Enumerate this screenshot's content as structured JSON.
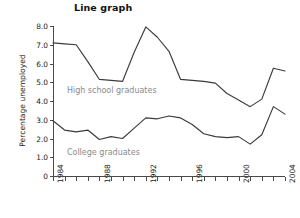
{
  "chart_data": {
    "type": "line",
    "title": "Line graph",
    "xlabel": "",
    "ylabel": "Percentage unemployed",
    "grid": false,
    "legend_position": "inline-annotation",
    "xlim": [
      1984,
      2004
    ],
    "ylim": [
      0,
      8
    ],
    "x": [
      1984,
      1985,
      1986,
      1987,
      1988,
      1989,
      1990,
      1991,
      1992,
      1993,
      1994,
      1995,
      1996,
      1997,
      1998,
      1999,
      2000,
      2001,
      2002,
      2003,
      2004
    ],
    "x_tick_labels": [
      "1984",
      "1988",
      "1992",
      "1996",
      "2000",
      "2004"
    ],
    "x_tick_values": [
      1984,
      1988,
      1992,
      1996,
      2000,
      2004
    ],
    "y_tick_labels": [
      "0",
      "1.0",
      "2.0",
      "3.0",
      "4.0",
      "5.0",
      "6.0",
      "7.0",
      "8.0"
    ],
    "y_tick_values": [
      0,
      1,
      2,
      3,
      4,
      5,
      6,
      7,
      8
    ],
    "series": [
      {
        "name": "High school graduates",
        "values": [
          7.1,
          7.05,
          7.0,
          6.1,
          5.15,
          5.1,
          5.05,
          6.6,
          7.95,
          7.4,
          6.65,
          5.15,
          5.1,
          5.05,
          4.95,
          4.4,
          4.05,
          3.7,
          4.1,
          5.75,
          5.6
        ],
        "label_x": 1985.2,
        "label_y": 4.5
      },
      {
        "name": "College graduates",
        "values": [
          2.95,
          2.45,
          2.35,
          2.45,
          1.95,
          2.1,
          2.0,
          2.55,
          3.1,
          3.05,
          3.2,
          3.1,
          2.75,
          2.25,
          2.1,
          2.05,
          2.1,
          1.7,
          2.2,
          3.7,
          3.3
        ],
        "label_x": 1985.2,
        "label_y": 1.2
      }
    ],
    "colors": {
      "line": "#3b3b3b",
      "axis": "#4a4a4a",
      "series_label": "#8a8a8a",
      "text": "#1a1a1a"
    }
  }
}
